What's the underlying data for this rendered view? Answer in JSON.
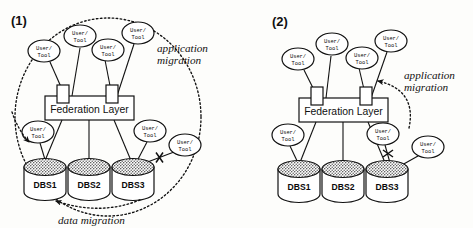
{
  "figure": {
    "background_color": "#fdfdfb",
    "ink_color": "#111111",
    "cylinder_top_fill": "#9a9a9a"
  },
  "panels": [
    {
      "id": "panel-1",
      "label": "(1)",
      "federation_layer_label": "Federation Layer",
      "databases": [
        {
          "label": "DBS1"
        },
        {
          "label": "DBS2"
        },
        {
          "label": "DBS3"
        }
      ],
      "nodes": [
        {
          "line1": "User/",
          "line2": "Tool"
        },
        {
          "line1": "User/",
          "line2": "Tool"
        },
        {
          "line1": "User/",
          "line2": "Tool"
        },
        {
          "line1": "User/",
          "line2": "Tool"
        },
        {
          "line1": "User/",
          "line2": "Tool"
        },
        {
          "line1": "User/",
          "line2": "Tool"
        },
        {
          "line1": "User/",
          "line2": "Tool"
        }
      ],
      "annotations": [
        {
          "id": "application-migration",
          "line1": "application",
          "line2": "migration"
        },
        {
          "id": "data-migration",
          "line1": "data migration",
          "line2": ""
        }
      ]
    },
    {
      "id": "panel-2",
      "label": "(2)",
      "federation_layer_label": "Federation Layer",
      "databases": [
        {
          "label": "DBS1"
        },
        {
          "label": "DBS2"
        },
        {
          "label": "DBS3"
        }
      ],
      "nodes": [
        {
          "line1": "User/",
          "line2": "Tool"
        },
        {
          "line1": "User/",
          "line2": "Tool"
        },
        {
          "line1": "User/",
          "line2": "Tool"
        },
        {
          "line1": "User/",
          "line2": "Tool"
        },
        {
          "line1": "User/",
          "line2": "Tool"
        },
        {
          "line1": "User/",
          "line2": "Tool"
        },
        {
          "line1": "User/",
          "line2": "Tool"
        }
      ],
      "annotations": [
        {
          "id": "application-migration",
          "line1": "application",
          "line2": "migration"
        }
      ]
    }
  ]
}
